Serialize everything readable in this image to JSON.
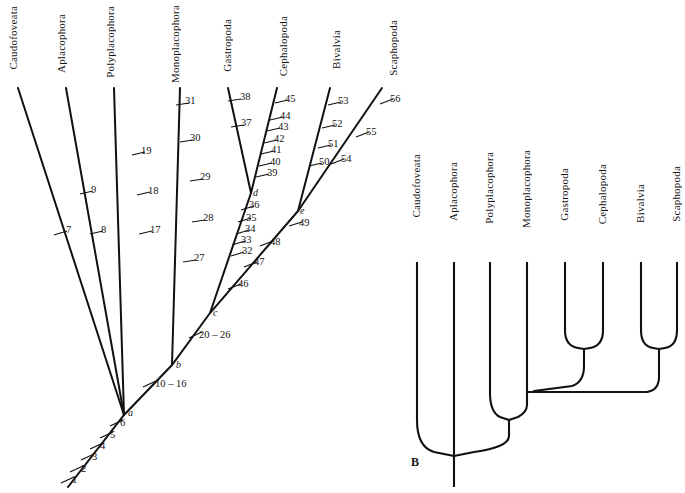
{
  "figure": {
    "background": "#ffffff",
    "line_color": "#111111",
    "panels": [
      {
        "id": "A",
        "label": "",
        "type": "phylogram-with-character-ticks"
      },
      {
        "id": "B",
        "label": "B",
        "type": "cladogram"
      }
    ]
  },
  "panelA": {
    "taxa": [
      {
        "name": "Caudofoveata",
        "label_x": 14,
        "label_y": 60,
        "tip_x": 18,
        "tip_y": 88
      },
      {
        "name": "Aplacophora",
        "label_x": 62,
        "label_y": 58,
        "tip_x": 66,
        "tip_y": 88
      },
      {
        "name": "Polyplacophora",
        "label_x": 112,
        "label_y": 63,
        "tip_x": 114,
        "tip_y": 88
      },
      {
        "name": "Monoplacophora",
        "label_x": 177,
        "label_y": 64,
        "tip_x": 180,
        "tip_y": 88
      },
      {
        "name": "Gastropoda",
        "label_x": 229,
        "label_y": 55,
        "tip_x": 228,
        "tip_y": 88
      },
      {
        "name": "Cephalopoda",
        "label_x": 286,
        "label_y": 57,
        "tip_x": 277,
        "tip_y": 88
      },
      {
        "name": "Bivalvia",
        "label_x": 337,
        "label_y": 48,
        "tip_x": 330,
        "tip_y": 88
      },
      {
        "name": "Scaphopoda",
        "label_x": 396,
        "label_y": 56,
        "tip_x": 382,
        "tip_y": 88
      }
    ],
    "nodes": [
      {
        "id": "a",
        "label": "a",
        "x": 124,
        "y": 415
      },
      {
        "id": "b",
        "label": "b",
        "x": 172,
        "y": 365
      },
      {
        "id": "c",
        "label": "c",
        "x": 210,
        "y": 313
      },
      {
        "id": "d",
        "label": "d",
        "x": 251,
        "y": 193
      },
      {
        "id": "e",
        "label": "e",
        "x": 298,
        "y": 211
      }
    ],
    "trunk_base": {
      "x": 68,
      "y": 487
    },
    "characters": {
      "trunk": [
        "1",
        "2",
        "3",
        "4",
        "5",
        "6"
      ],
      "stem_b": [
        "10 – 16"
      ],
      "stem_c": [
        "20 – 26"
      ],
      "caudofoveata": [
        "7"
      ],
      "aplacophora": [
        "8",
        "9"
      ],
      "polyplacophora": [
        "17",
        "18",
        "19"
      ],
      "monoplacophora": [
        "27",
        "28",
        "29",
        "30",
        "31"
      ],
      "gastropoda_cephalopoda_stem": [
        "32",
        "33",
        "34",
        "35",
        "36"
      ],
      "gastropoda": [
        "37",
        "38"
      ],
      "cephalopoda": [
        "39",
        "40",
        "41",
        "42",
        "43",
        "44",
        "45"
      ],
      "bivalvia_scaphopoda_stem": [
        "46",
        "47",
        "48",
        "49"
      ],
      "bivalvia": [
        "50",
        "51",
        "52",
        "53"
      ],
      "scaphopoda": [
        "54",
        "55",
        "56"
      ]
    },
    "tick_labels": [
      {
        "text": "1",
        "x": 72,
        "y": 481
      },
      {
        "text": "2",
        "x": 81,
        "y": 470
      },
      {
        "text": "3",
        "x": 92,
        "y": 458
      },
      {
        "text": "4",
        "x": 100,
        "y": 447
      },
      {
        "text": "5",
        "x": 110,
        "y": 436
      },
      {
        "text": "6",
        "x": 120,
        "y": 424
      },
      {
        "text": "10 – 16",
        "x": 155,
        "y": 385
      },
      {
        "text": "20 – 26",
        "x": 199,
        "y": 336
      },
      {
        "text": "7",
        "x": 66,
        "y": 231
      },
      {
        "text": "8",
        "x": 101,
        "y": 231
      },
      {
        "text": "9",
        "x": 91,
        "y": 191
      },
      {
        "text": "17",
        "x": 150,
        "y": 231
      },
      {
        "text": "18",
        "x": 148,
        "y": 192
      },
      {
        "text": "19",
        "x": 141,
        "y": 152
      },
      {
        "text": "27",
        "x": 194,
        "y": 259
      },
      {
        "text": "28",
        "x": 203,
        "y": 219
      },
      {
        "text": "29",
        "x": 200,
        "y": 178
      },
      {
        "text": "30",
        "x": 190,
        "y": 139
      },
      {
        "text": "31",
        "x": 185,
        "y": 102
      },
      {
        "text": "32",
        "x": 242,
        "y": 252
      },
      {
        "text": "33",
        "x": 241,
        "y": 241
      },
      {
        "text": "34",
        "x": 245,
        "y": 230
      },
      {
        "text": "35",
        "x": 246,
        "y": 219
      },
      {
        "text": "36",
        "x": 249,
        "y": 206
      },
      {
        "text": "37",
        "x": 241,
        "y": 124
      },
      {
        "text": "38",
        "x": 240,
        "y": 98
      },
      {
        "text": "39",
        "x": 267,
        "y": 174
      },
      {
        "text": "40",
        "x": 270,
        "y": 163
      },
      {
        "text": "41",
        "x": 271,
        "y": 151
      },
      {
        "text": "42",
        "x": 274,
        "y": 140
      },
      {
        "text": "43",
        "x": 278,
        "y": 128
      },
      {
        "text": "44",
        "x": 280,
        "y": 117
      },
      {
        "text": "45",
        "x": 285,
        "y": 100
      },
      {
        "text": "46",
        "x": 238,
        "y": 285
      },
      {
        "text": "47",
        "x": 254,
        "y": 263
      },
      {
        "text": "48",
        "x": 270,
        "y": 243
      },
      {
        "text": "49",
        "x": 299,
        "y": 224
      },
      {
        "text": "50",
        "x": 319,
        "y": 163
      },
      {
        "text": "51",
        "x": 328,
        "y": 145
      },
      {
        "text": "52",
        "x": 332,
        "y": 125
      },
      {
        "text": "53",
        "x": 338,
        "y": 102
      },
      {
        "text": "54",
        "x": 341,
        "y": 160
      },
      {
        "text": "55",
        "x": 366,
        "y": 133
      },
      {
        "text": "56",
        "x": 390,
        "y": 100
      }
    ]
  },
  "panelB": {
    "label": "B",
    "label_x": 411,
    "label_y": 458,
    "taxa": [
      {
        "name": "Caudofoveata",
        "label_x": 411,
        "label_y": 228,
        "tip_x": 417,
        "tip_y": 262
      },
      {
        "name": "Aplacophora",
        "label_x": 449,
        "label_y": 222,
        "tip_x": 454,
        "tip_y": 262
      },
      {
        "name": "Polyplacophora",
        "label_x": 487,
        "label_y": 232,
        "tip_x": 490,
        "tip_y": 262
      },
      {
        "name": "Monoplacophora",
        "label_x": 524,
        "label_y": 234,
        "tip_x": 527,
        "tip_y": 262
      },
      {
        "name": "Gastropoda",
        "label_x": 562,
        "label_y": 218,
        "tip_x": 565,
        "tip_y": 262
      },
      {
        "name": "Cephalopoda",
        "label_x": 600,
        "label_y": 221,
        "tip_x": 603,
        "tip_y": 262
      },
      {
        "name": "Bivalvia",
        "label_x": 638,
        "label_y": 206,
        "tip_x": 641,
        "tip_y": 262
      },
      {
        "name": "Scaphopoda",
        "label_x": 674,
        "label_y": 218,
        "tip_x": 677,
        "tip_y": 262
      }
    ],
    "root": {
      "x": 454,
      "y": 455
    },
    "topology": "(Caudofoveata,(Aplacophora,(Polyplacophora,(Monoplacophora,((Gastropoda,Cephalopoda),(Bivalvia,Scaphopoda))))))"
  }
}
